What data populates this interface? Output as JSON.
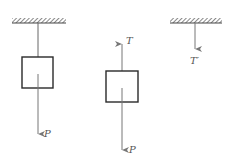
{
  "diagram": {
    "colors": {
      "ink": "#2a2a2a",
      "line": "#666666",
      "arrow": "#777777",
      "hatch": "#555555"
    },
    "panels": [
      {
        "id": "hanging-block",
        "elements": [
          "ceiling-support",
          "rope",
          "block",
          "weight-arrow"
        ],
        "labels": {
          "weight": "P"
        }
      },
      {
        "id": "block-free-body",
        "elements": [
          "block",
          "tension-arrow-up",
          "weight-arrow"
        ],
        "labels": {
          "tension": "T",
          "weight": "P"
        }
      },
      {
        "id": "support-reaction",
        "elements": [
          "ceiling-support",
          "reaction-arrow-down"
        ],
        "labels": {
          "reaction": "T′"
        }
      }
    ]
  }
}
